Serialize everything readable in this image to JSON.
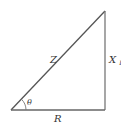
{
  "diagram": {
    "type": "impedance-triangle",
    "vertices": {
      "origin": [
        11,
        110
      ],
      "right_angle": [
        105,
        110
      ],
      "apex": [
        105,
        11
      ]
    },
    "line_color": "#555555",
    "labels": {
      "hypotenuse": "Z",
      "vertical_side": "X",
      "vertical_side_subscript": "L",
      "base": "R",
      "angle": "θ"
    }
  }
}
